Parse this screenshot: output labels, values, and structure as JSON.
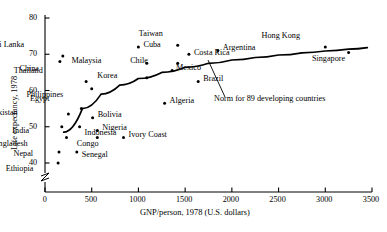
{
  "chart_data": {
    "type": "scatter",
    "title": "",
    "xlabel": "GNP/person, 1978 (U.S. dollars)",
    "ylabel": "Life expectancy, 1978",
    "xlim": [
      0,
      3500
    ],
    "ylim": [
      38,
      81
    ],
    "grid": false,
    "legend": "none",
    "y_axis_break": true,
    "xticks": [
      "0",
      "500",
      "1000",
      "1500",
      "2000",
      "2500",
      "3000",
      "3500"
    ],
    "xtick_values": [
      0,
      500,
      1000,
      1500,
      2000,
      2500,
      3000,
      3500
    ],
    "yticks": [
      "40",
      "50",
      "60",
      "70",
      "80"
    ],
    "ytick_values": [
      40,
      50,
      60,
      70,
      80
    ],
    "points": [
      {
        "name": "Sri Lanka",
        "x": 190,
        "y": 69.5,
        "lx": -36,
        "ly": -12
      },
      {
        "name": "China",
        "x": 160,
        "y": 68.0,
        "lx": -23,
        "ly": 6
      },
      {
        "name": "Cuba",
        "x": 1000,
        "y": 72.0,
        "lx": 5,
        "ly": -3.5
      },
      {
        "name": "Taiwan",
        "x": 1420,
        "y": 72.5,
        "lx": -17,
        "ly": -12
      },
      {
        "name": "Chile",
        "x": 1420,
        "y": 67.5,
        "lx": -30,
        "ly": -3
      },
      {
        "name": "Costa Rica",
        "x": 1540,
        "y": 70.0,
        "lx": 5,
        "ly": -2
      },
      {
        "name": "Argentina",
        "x": 1850,
        "y": 71.0,
        "lx": 5,
        "ly": -3.5
      },
      {
        "name": "Hong Kong",
        "x": 3000,
        "y": 72.0,
        "lx": -29,
        "ly": -12
      },
      {
        "name": "Singapore",
        "x": 3250,
        "y": 70.5,
        "lx": -2,
        "ly": 6
      },
      {
        "name": "Malaysia",
        "x": 1090,
        "y": 67.5,
        "lx": -45,
        "ly": -3
      },
      {
        "name": "Mexico",
        "x": 1360,
        "y": 65.5,
        "lx": 4,
        "ly": -3.5
      },
      {
        "name": "Thailand",
        "x": 440,
        "y": 62.5,
        "lx": -42,
        "ly": -11
      },
      {
        "name": "Korea",
        "x": 1090,
        "y": 63.5,
        "lx": -32,
        "ly": -3
      },
      {
        "name": "Brazil",
        "x": 1640,
        "y": 62.5,
        "lx": 5,
        "ly": -3.5
      },
      {
        "name": "Philippines",
        "x": 500,
        "y": 60.5,
        "lx": -22,
        "ly": 5
      },
      {
        "name": "Algeria",
        "x": 1280,
        "y": 56.5,
        "lx": 5,
        "ly": -3.5
      },
      {
        "name": "Egypt",
        "x": 390,
        "y": 55.0,
        "lx": -34,
        "ly": -11
      },
      {
        "name": "Pakistan",
        "x": 250,
        "y": 53.5,
        "lx": -48,
        "ly": -2.5
      },
      {
        "name": "Bolivia",
        "x": 510,
        "y": 52.5,
        "lx": 5,
        "ly": -3.5
      },
      {
        "name": "Indonesia",
        "x": 370,
        "y": 50.0,
        "lx": 5,
        "ly": 5
      },
      {
        "name": "India",
        "x": 180,
        "y": 50.0,
        "lx": -32,
        "ly": 3
      },
      {
        "name": "Nigeria",
        "x": 560,
        "y": 49.0,
        "lx": 5,
        "ly": -3.5
      },
      {
        "name": "Ivory Coast",
        "x": 840,
        "y": 47.0,
        "lx": 5,
        "ly": -3.5
      },
      {
        "name": "Bangladesh",
        "x": 230,
        "y": 47.0,
        "lx": -38,
        "ly": 5
      },
      {
        "name": "Congo",
        "x": 560,
        "y": 47.0,
        "lx": -3,
        "ly": 5
      },
      {
        "name": "Senegal",
        "x": 340,
        "y": 43.0,
        "lx": 5,
        "ly": 2
      },
      {
        "name": "Nepal",
        "x": 150,
        "y": 43.0,
        "lx": -28,
        "ly": 1
      },
      {
        "name": "Ethiopia",
        "x": 140,
        "y": 40.0,
        "lx": -22,
        "ly": 5
      }
    ],
    "curve": {
      "label": "Norm for 89 developing countries",
      "points": [
        {
          "x": 200,
          "y": 48.5
        },
        {
          "x": 400,
          "y": 55.0
        },
        {
          "x": 600,
          "y": 59.0
        },
        {
          "x": 800,
          "y": 61.5
        },
        {
          "x": 1000,
          "y": 63.3
        },
        {
          "x": 1250,
          "y": 65.0
        },
        {
          "x": 1500,
          "y": 66.4
        },
        {
          "x": 1750,
          "y": 67.5
        },
        {
          "x": 2000,
          "y": 68.4
        },
        {
          "x": 2250,
          "y": 69.1
        },
        {
          "x": 2500,
          "y": 69.8
        },
        {
          "x": 2750,
          "y": 70.4
        },
        {
          "x": 3000,
          "y": 70.9
        },
        {
          "x": 3250,
          "y": 71.4
        },
        {
          "x": 3450,
          "y": 71.8
        }
      ]
    }
  },
  "style": {
    "axis_color": "#000000",
    "point_color": "#000000",
    "curve_color": "#000000",
    "background": "#ffffff"
  }
}
